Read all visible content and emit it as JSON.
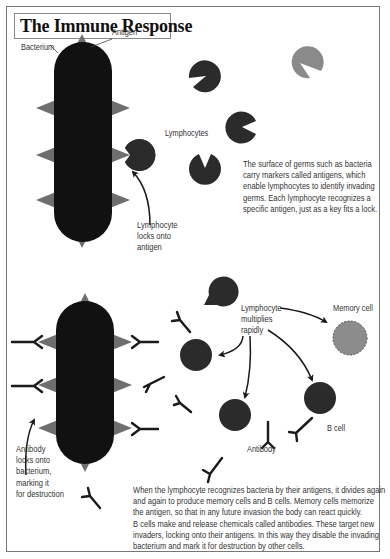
{
  "title": "The Immune Response",
  "colors": {
    "bacterium": "#111111",
    "antigen": "#6e6e6e",
    "lymphocyte": "#2b2b2b",
    "lymphocyte_light": "#8a8a8a",
    "memory_cell": "#8c8c8c",
    "antibody": "#1a1a1a",
    "text": "#333333",
    "border": "#777777"
  },
  "top_panel": {
    "labels": {
      "bacterium": "Bacterium",
      "antigen": "Antigen",
      "lymphocytes": "Lymphocytes",
      "lock_caption": [
        "Lymphocyte",
        "locks onto",
        "antigen"
      ]
    },
    "description": [
      "The surface of germs such as bacteria",
      "carry markers called antigens, which",
      "enable lymphocytes to identify invading",
      "germs. Each lymphocyte recognizes a",
      "specific antigen, just as a key fits a lock."
    ]
  },
  "bottom_panel": {
    "labels": {
      "multiplies": [
        "Lymphocyte",
        "multiplies",
        "rapidly"
      ],
      "memory_cell": "Memory cell",
      "b_cell": "B cell",
      "antibody": "Antibody",
      "antibody_caption": [
        "Antibody",
        "locks onto",
        "bacterium,",
        "marking it",
        "for destruction"
      ]
    },
    "description": [
      "When the lymphocyte recognizes bacteria by their antigens, it divides again",
      "and again to produce memory cells and B cells. Memory cells memorize",
      "the antigen, so that in any future invasion the body can react quickly.",
      "B cells make and release chemicals called antibodies. These target new",
      "invaders, locking onto their antigens. In this way they disable the invading",
      "bacterium and mark it for destruction by other cells."
    ]
  }
}
